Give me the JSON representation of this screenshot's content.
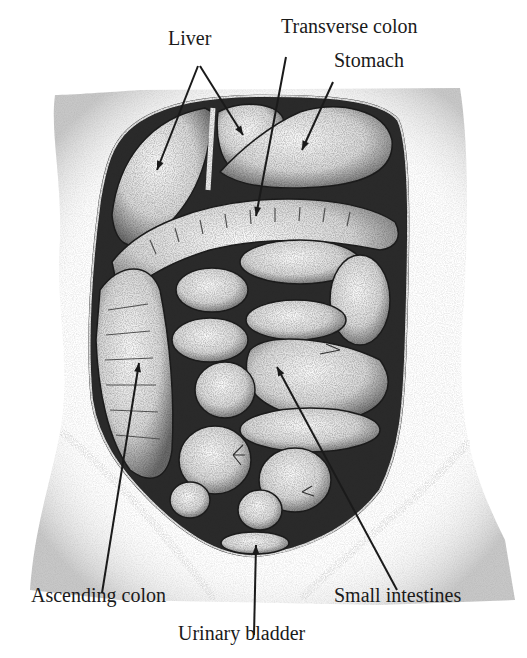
{
  "figure": {
    "colors": {
      "ink": "#1a1a1a",
      "skin_shade": "#cfcfcf",
      "cavity_dark": "#2b2b2b",
      "organ_light": "#f2f2f2",
      "organ_mid": "#bdbdbd",
      "background": "#ffffff"
    }
  },
  "labels": [
    {
      "id": "liver",
      "text": "Liver",
      "x": 168,
      "y": 44
    },
    {
      "id": "transverse-colon",
      "text": "Transverse colon",
      "x": 281,
      "y": 32
    },
    {
      "id": "stomach",
      "text": "Stomach",
      "x": 334,
      "y": 66
    },
    {
      "id": "ascending-colon",
      "text": "Ascending colon",
      "x": 31,
      "y": 601
    },
    {
      "id": "urinary-bladder",
      "text": "Urinary bladder",
      "x": 178,
      "y": 639
    },
    {
      "id": "small-intestines",
      "text": "Small intestines",
      "x": 334,
      "y": 601
    }
  ],
  "pointers": [
    {
      "id": "liver-1",
      "x1": 198,
      "y1": 66,
      "x2": 157,
      "y2": 170
    },
    {
      "id": "liver-2",
      "x1": 200,
      "y1": 66,
      "x2": 243,
      "y2": 135
    },
    {
      "id": "transverse-colon",
      "x1": 286,
      "y1": 57,
      "x2": 256,
      "y2": 216
    },
    {
      "id": "stomach",
      "x1": 333,
      "y1": 82,
      "x2": 302,
      "y2": 150
    },
    {
      "id": "ascending-colon",
      "x1": 102,
      "y1": 593,
      "x2": 139,
      "y2": 363
    },
    {
      "id": "urinary-bladder",
      "x1": 254,
      "y1": 635,
      "x2": 256,
      "y2": 545
    },
    {
      "id": "small-intestines",
      "x1": 397,
      "y1": 590,
      "x2": 277,
      "y2": 367
    }
  ]
}
